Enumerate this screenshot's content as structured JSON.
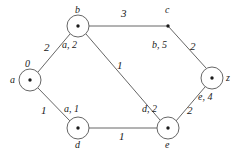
{
  "figure": {
    "kind": "weighted-undirected-graph",
    "stroke_color": "#555555",
    "text_color": "#1a1a1a",
    "background": "#ffffff"
  },
  "nodes": [
    {
      "id": "a",
      "name": "a",
      "label": "0",
      "shape": "circled-dot",
      "cx": 30,
      "cy": 80,
      "r": 11,
      "name_pos": "left",
      "label_pos": "top"
    },
    {
      "id": "b",
      "name": "b",
      "label": "a, 2",
      "shape": "circled-dot",
      "cx": 78,
      "cy": 26,
      "r": 11,
      "name_pos": "top",
      "label_pos": "bottom"
    },
    {
      "id": "c",
      "name": "c",
      "label": "b, 5",
      "shape": "dot",
      "cx": 168,
      "cy": 26,
      "r": 0,
      "name_pos": "top",
      "label_pos": "bottom"
    },
    {
      "id": "d",
      "name": "d",
      "label": "a, 1",
      "shape": "circled-dot",
      "cx": 78,
      "cy": 128,
      "r": 11,
      "name_pos": "bottom",
      "label_pos": "top"
    },
    {
      "id": "e",
      "name": "e",
      "label": "d, 2",
      "shape": "circled-dot",
      "cx": 168,
      "cy": 128,
      "r": 11,
      "name_pos": "bottom",
      "label_pos": "top"
    },
    {
      "id": "z",
      "name": "z",
      "label": "e, 4",
      "shape": "circled-dot",
      "cx": 212,
      "cy": 78,
      "r": 11,
      "name_pos": "right",
      "label_pos": "bottom"
    }
  ],
  "edges": [
    {
      "from": "a",
      "to": "b",
      "weight": "2",
      "lx": 47,
      "ly": 48
    },
    {
      "from": "a",
      "to": "d",
      "weight": "1",
      "lx": 44,
      "ly": 110
    },
    {
      "from": "b",
      "to": "c",
      "weight": "3",
      "lx": 124,
      "ly": 14
    },
    {
      "from": "b",
      "to": "e",
      "weight": "1",
      "lx": 119,
      "ly": 67
    },
    {
      "from": "d",
      "to": "e",
      "weight": "1",
      "lx": 121,
      "ly": 136
    },
    {
      "from": "c",
      "to": "z",
      "weight": "2",
      "lx": 191,
      "ly": 47
    },
    {
      "from": "e",
      "to": "z",
      "weight": "2",
      "lx": 190,
      "ly": 110
    }
  ],
  "node_names": {
    "a": "a",
    "b": "b",
    "c": "c",
    "d": "d",
    "e": "e",
    "z": "z"
  },
  "node_labels": {
    "a": "0",
    "b": "a, 2",
    "c": "b, 5",
    "d": "a, 1",
    "e": "d, 2",
    "z": "e, 4"
  },
  "edge_weights": {
    "ab": "2",
    "ad": "1",
    "bc": "3",
    "be": "1",
    "de": "1",
    "cz": "2",
    "ez": "2"
  }
}
